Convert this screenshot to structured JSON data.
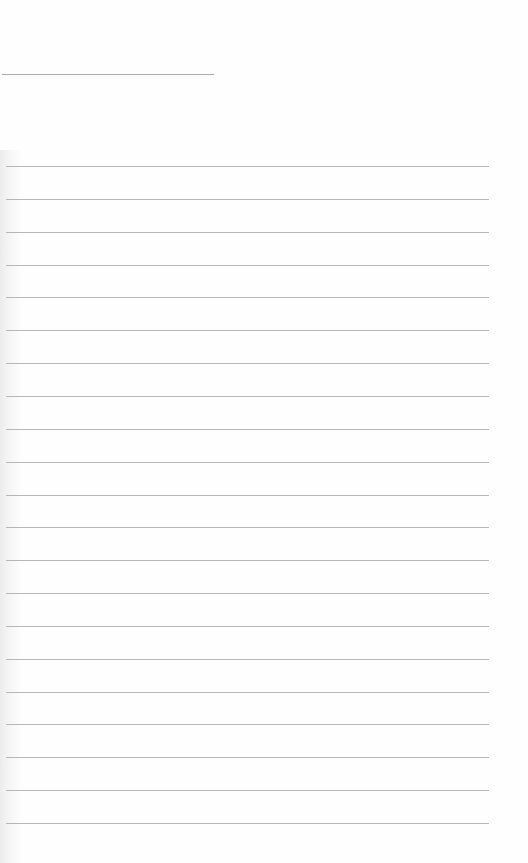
{
  "document": {
    "type": "lined-notepaper",
    "title_line": {
      "text": ""
    },
    "ruled_lines": [
      {
        "text": ""
      },
      {
        "text": ""
      },
      {
        "text": ""
      },
      {
        "text": ""
      },
      {
        "text": ""
      },
      {
        "text": ""
      },
      {
        "text": ""
      },
      {
        "text": ""
      },
      {
        "text": ""
      },
      {
        "text": ""
      },
      {
        "text": ""
      },
      {
        "text": ""
      },
      {
        "text": ""
      },
      {
        "text": ""
      },
      {
        "text": ""
      },
      {
        "text": ""
      },
      {
        "text": ""
      },
      {
        "text": ""
      },
      {
        "text": ""
      },
      {
        "text": ""
      },
      {
        "text": ""
      }
    ],
    "colors": {
      "paper": "#fefefe",
      "rule": "#b8b8b8",
      "binding_shadow": "#ececec"
    }
  }
}
